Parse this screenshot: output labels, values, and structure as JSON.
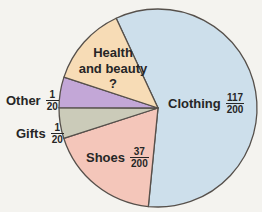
{
  "chart_data": {
    "type": "pie",
    "title": "",
    "total": 200,
    "legend_position": "labels-on-chart",
    "slices": [
      {
        "name": "clothing",
        "label": "Clothing",
        "fraction": {
          "num": "117",
          "den": "200"
        },
        "value": 117,
        "color": "#cddfeb"
      },
      {
        "name": "shoes",
        "label": "Shoes",
        "fraction": {
          "num": "37",
          "den": "200"
        },
        "value": 37,
        "color": "#f4c6ba"
      },
      {
        "name": "gifts",
        "label": "Gifts",
        "fraction": {
          "num": "1",
          "den": "20"
        },
        "value": 10,
        "color": "#cbcbb9"
      },
      {
        "name": "other",
        "label": "Other",
        "fraction": {
          "num": "1",
          "den": "20"
        },
        "value": 10,
        "color": "#c3a7d7"
      },
      {
        "name": "health_and_beauty",
        "label_line1": "Health",
        "label_line2": "and beauty",
        "value_display": "?",
        "value": 26,
        "color": "#f7dcb6"
      }
    ],
    "outline_color": "#56504b",
    "background_color": "#f4f3ef",
    "text_color": "#262626"
  }
}
